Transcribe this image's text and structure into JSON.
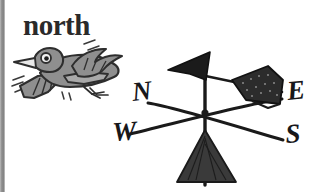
{
  "page": {
    "kind": "scanned-illustration",
    "background_color": "#ffffff",
    "width": 322,
    "height": 192
  },
  "edge": {
    "name": "scan-binding-stripe",
    "color": "#8d8d8d",
    "width_px": 5
  },
  "heading": {
    "text": "north",
    "color": "#2a2a2a"
  },
  "illustration": {
    "title": "bird flying toward a weather vane",
    "bird": {
      "name": "cartoon bird",
      "body_color": "#8f8f8f",
      "outline_color": "#2e2e2e",
      "facing": "right",
      "motion_lines": 6
    },
    "weather_vane": {
      "name": "weather vane",
      "ink_color": "#1a1a1a",
      "arrow_points_to": "west",
      "pointer_arrowhead": "black triangle",
      "fletching": "stippled dark quadrilateral",
      "mast_fin": "dark triangular fin"
    },
    "compass_labels": [
      {
        "id": "north",
        "letter": "N",
        "x": 133,
        "y": 101
      },
      {
        "id": "east",
        "letter": "E",
        "x": 288,
        "y": 100
      },
      {
        "id": "west",
        "letter": "W",
        "x": 113,
        "y": 139
      },
      {
        "id": "south",
        "letter": "S",
        "x": 286,
        "y": 142
      }
    ],
    "cross_center": {
      "x": 205,
      "y": 113
    }
  }
}
